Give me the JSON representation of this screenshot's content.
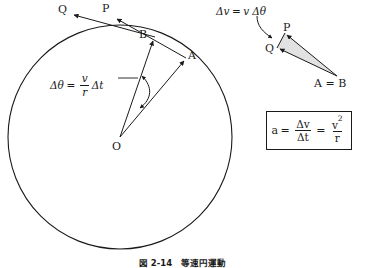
{
  "figure": {
    "domain_note": "physics diagram: uniform circular motion and centripetal acceleration",
    "caption": "図 2-14　等速円運動",
    "background_color": "#ffffff",
    "stroke_color": "#1a1a1a",
    "triangle_fill_color": "#e2e2e2"
  },
  "circle": {
    "center_label": "O",
    "center_x": 120,
    "center_y": 137,
    "radius": 112
  },
  "points": [
    {
      "id": "A",
      "label": "A",
      "x": 186,
      "y": 58,
      "role": "position-at-time-t"
    },
    {
      "id": "B",
      "label": "B",
      "x": 152,
      "y": 38,
      "role": "position-at-time-t-plus-dt"
    },
    {
      "id": "O",
      "label": "O",
      "x": 120,
      "y": 143,
      "role": "circle-center"
    }
  ],
  "velocity_vectors": [
    {
      "id": "P",
      "label": "P",
      "x": 106,
      "y": 10,
      "role": "velocity-at-A"
    },
    {
      "id": "Q",
      "label": "Q",
      "x": 62,
      "y": 10,
      "role": "velocity-at-B"
    }
  ],
  "angle_annotation": {
    "name": "delta-theta-formula",
    "lhs": "Δθ",
    "equals": "=",
    "numerator": "v",
    "denominator": "r",
    "trailing": "Δt",
    "plain": "Δθ = (v/r)Δt"
  },
  "triangle": {
    "name": "velocity-difference-triangle",
    "vertices": [
      {
        "id": "P",
        "label": "P",
        "x": 285,
        "y": 33
      },
      {
        "id": "Q",
        "label": "Q",
        "x": 277,
        "y": 48
      },
      {
        "id": "AB",
        "label": "A = B",
        "x": 337,
        "y": 76
      }
    ],
    "annotation": {
      "name": "delta-v-formula",
      "lhs": "Δv",
      "equals": "=",
      "rhs_scalar": "v",
      "rhs_angle": "Δθ",
      "plain": "Δv = v Δθ"
    }
  },
  "formula_box": {
    "name": "acceleration-formula",
    "lhs": "a",
    "equals_1": "=",
    "frac1_num": "Δv",
    "frac1_den": "Δt",
    "equals_2": "=",
    "frac2_num": "v",
    "frac2_num_exp": "2",
    "frac2_den": "r",
    "plain": "a = Δv/Δt = v²/r",
    "x": 266,
    "y": 111,
    "width": 86,
    "height": 39
  }
}
